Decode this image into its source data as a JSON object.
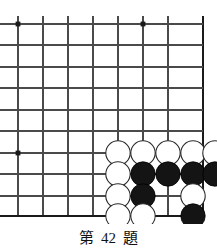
{
  "board": {
    "label": "go-board-corner-diagram",
    "colors": {
      "background": "#ffffff",
      "grid_line": "#4a4a4a",
      "edge_line": "#1a1a1a",
      "star_point": "#1a1a1a",
      "black_stone_fill": "#141414",
      "black_stone_edge": "#000000",
      "white_stone_fill": "#ffffff",
      "white_stone_edge": "#2a2a2a"
    },
    "geometry": {
      "x_lines": [
        18,
        43,
        68,
        93,
        118,
        143,
        168,
        203
      ],
      "y_lines": [
        24,
        45,
        67,
        88,
        110,
        131,
        153,
        174,
        196,
        216
      ],
      "right_edge_x": 203,
      "bottom_edge_y": 216,
      "stone_radius": 12.2,
      "grid_line_width": 1.1,
      "edge_line_width": 2.4
    },
    "star_points": [
      {
        "x": 18,
        "y": 24
      },
      {
        "x": 143,
        "y": 24
      },
      {
        "x": 18,
        "y": 153
      }
    ],
    "stones": [
      {
        "color": "white",
        "x": 118,
        "y": 153
      },
      {
        "color": "white",
        "x": 143,
        "y": 153
      },
      {
        "color": "white",
        "x": 168,
        "y": 153
      },
      {
        "color": "white",
        "x": 193,
        "y": 153
      },
      {
        "color": "white",
        "x": 215,
        "y": 153
      },
      {
        "color": "white",
        "x": 118,
        "y": 174
      },
      {
        "color": "black",
        "x": 143,
        "y": 174
      },
      {
        "color": "black",
        "x": 168,
        "y": 174
      },
      {
        "color": "black",
        "x": 193,
        "y": 174
      },
      {
        "color": "black",
        "x": 215,
        "y": 174
      },
      {
        "color": "white",
        "x": 118,
        "y": 196
      },
      {
        "color": "black",
        "x": 143,
        "y": 196
      },
      {
        "color": "white",
        "x": 193,
        "y": 196
      },
      {
        "color": "white",
        "x": 118,
        "y": 216
      },
      {
        "color": "white",
        "x": 143,
        "y": 216
      },
      {
        "color": "black",
        "x": 193,
        "y": 216
      }
    ]
  },
  "caption": {
    "prefix": "第",
    "number": "42",
    "suffix": "題"
  }
}
